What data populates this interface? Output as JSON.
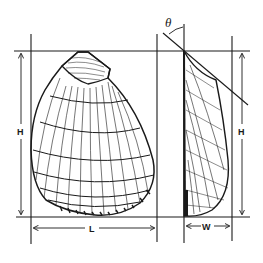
{
  "figure": {
    "views": [
      "lateral view",
      "side profile view"
    ]
  },
  "labels": {
    "height_left": "H",
    "height_right": "H",
    "length": "L",
    "width": "W",
    "angle": "θ"
  },
  "colors": {
    "ink": "#1a1a1a",
    "background": "#ffffff"
  }
}
